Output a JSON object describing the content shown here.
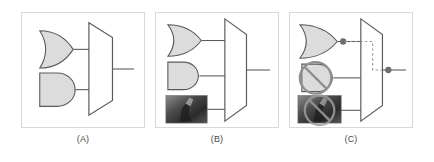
{
  "figure": {
    "width": 434,
    "height": 162,
    "background": "#ffffff",
    "panel_border_color": "#d8d8d8",
    "gate_fill": "#dcdcdc",
    "gate_stroke": "#5a5a5a",
    "wire_color": "#5a5a5a",
    "dot_color": "#6e6e6e",
    "dashed_color": "#9a9a9a",
    "thumb_dark": "#2e2e2e",
    "thumb_light": "#b9b9b9",
    "prohibition_color": "#8f8f8f"
  },
  "panels": [
    {
      "id": "a",
      "label": "(A)",
      "inputs": [
        {
          "kind": "or-gate",
          "name": "or-gate",
          "position": "top"
        },
        {
          "kind": "and-gate",
          "name": "and-gate",
          "position": "middle"
        }
      ],
      "combiner": "mux-trapezoid",
      "output": "wire",
      "has_dashed_route": false,
      "has_output_dot": false
    },
    {
      "id": "b",
      "label": "(B)",
      "inputs": [
        {
          "kind": "or-gate",
          "name": "or-gate",
          "position": "top"
        },
        {
          "kind": "and-gate",
          "name": "and-gate",
          "position": "middle"
        },
        {
          "kind": "image-thumbnail",
          "name": "photo-thumbnail",
          "position": "bottom"
        }
      ],
      "combiner": "mux-trapezoid",
      "output": "wire",
      "has_dashed_route": false,
      "has_output_dot": false
    },
    {
      "id": "c",
      "label": "(C)",
      "inputs": [
        {
          "kind": "or-gate",
          "name": "or-gate",
          "position": "top",
          "selected": true
        },
        {
          "kind": "prohibited-gate",
          "name": "blocked-gate",
          "position": "middle",
          "selected": false
        },
        {
          "kind": "prohibited-image",
          "name": "blocked-photo-thumbnail",
          "position": "bottom",
          "selected": false
        }
      ],
      "combiner": "mux-trapezoid",
      "output": "wire",
      "has_dashed_route": true,
      "has_output_dot": true
    }
  ]
}
